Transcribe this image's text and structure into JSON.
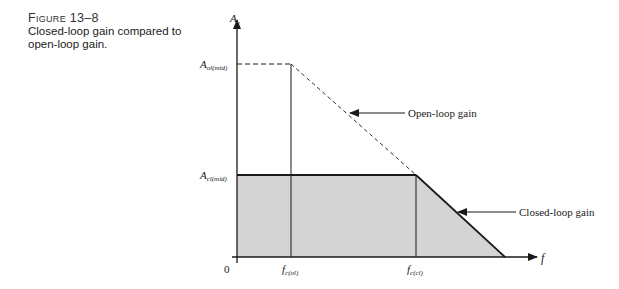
{
  "caption": {
    "figure_label": "Figure 13–8",
    "text_line1": "Closed-loop gain compared to",
    "text_line2": "open-loop gain."
  },
  "diagram": {
    "y_axis_label": "A",
    "y_axis_sub": "v",
    "x_axis_label": "f",
    "origin_label": "0",
    "a_ol_label": "A",
    "a_ol_sub": "ol(mid)",
    "a_cl_label": "A",
    "a_cl_sub": "cl(mid)",
    "fc_ol_label": "f",
    "fc_ol_sub": "c(ol)",
    "fc_cl_label": "f",
    "fc_cl_sub": "c(cl)",
    "open_loop_callout": "Open-loop gain",
    "closed_loop_callout": "Closed-loop gain",
    "colors": {
      "shade": "#d4d4d4",
      "line": "#1a1a1a"
    }
  }
}
